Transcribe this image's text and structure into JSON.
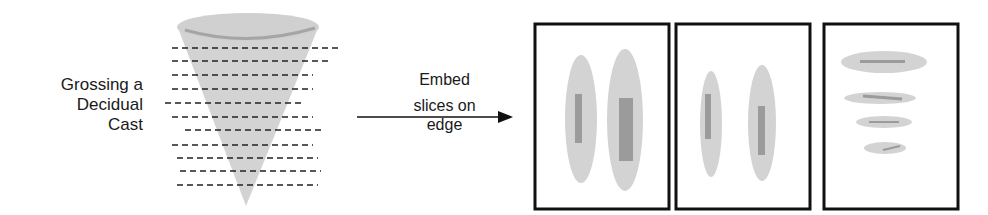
{
  "source": {
    "label_lines": [
      "Grossing a",
      "Decidual",
      "Cast"
    ]
  },
  "process": {
    "label_top": "Embed",
    "label_bottom_lines": [
      "slices on",
      "edge"
    ]
  },
  "colors": {
    "tissue": "#d3d3d3",
    "tissue_rim": "#a5a5a5",
    "section_bar": "#9b9b9b",
    "frame": "#111111",
    "cut_line": "#222222"
  },
  "panels": [
    {
      "id": "cassette-1",
      "content": "two vertical elongated slices"
    },
    {
      "id": "cassette-2",
      "content": "two vertical narrow slices"
    },
    {
      "id": "cassette-3",
      "content": "four horizontal slices decreasing in size"
    }
  ]
}
